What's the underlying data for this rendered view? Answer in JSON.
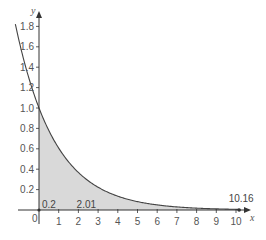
{
  "chart_data": {
    "type": "area",
    "title": "",
    "function": "y = e^(-x/2)",
    "xlabel": "x",
    "ylabel": "y",
    "origin_label": "0",
    "xlim": [
      -1.2,
      10.5
    ],
    "ylim": [
      0,
      1.9
    ],
    "x_ticks": [
      1,
      2,
      3,
      4,
      5,
      6,
      7,
      8,
      9,
      10
    ],
    "y_ticks": [
      0.2,
      0.4,
      0.6,
      0.8,
      1.0,
      1.2,
      1.4,
      1.6,
      1.8
    ],
    "y_tick_labels": [
      "0.2",
      "0.4",
      "0.6",
      "0.8",
      "1.0",
      "1.2",
      "1.4",
      "1.6",
      "1.8"
    ],
    "grid": false,
    "shaded_region": {
      "from": 0,
      "to": 10.16,
      "color": "#d9d9d9"
    },
    "curve_points": [
      {
        "x": -1.2,
        "y": 1.82
      },
      {
        "x": 0,
        "y": 1.0
      },
      {
        "x": 1,
        "y": 0.61
      },
      {
        "x": 2,
        "y": 0.37
      },
      {
        "x": 3,
        "y": 0.22
      },
      {
        "x": 4,
        "y": 0.14
      },
      {
        "x": 5,
        "y": 0.08
      },
      {
        "x": 6,
        "y": 0.05
      },
      {
        "x": 7,
        "y": 0.03
      },
      {
        "x": 8,
        "y": 0.02
      },
      {
        "x": 9,
        "y": 0.01
      },
      {
        "x": 10,
        "y": 0.01
      }
    ],
    "annotations": [
      {
        "text": "0.2",
        "x": 0.2,
        "position": "above-axis"
      },
      {
        "text": "2.01",
        "x": 2.01,
        "position": "above-axis"
      },
      {
        "text": "10.16",
        "x": 10.16,
        "position": "above-axis",
        "marker": "dot"
      }
    ],
    "colors": {
      "axis": "#333333",
      "curve": "#444444",
      "fill": "#d9d9d9",
      "text": "#555555"
    }
  }
}
